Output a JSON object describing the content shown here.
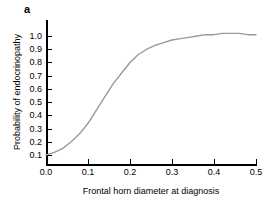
{
  "panel": {
    "label": "a"
  },
  "chart_data": {
    "type": "line",
    "title": "",
    "xlabel": "Frontal horn diameter at diagnosis",
    "ylabel": "Probability of endocrinopathy",
    "xlim": [
      0.0,
      0.5
    ],
    "ylim": [
      0.06,
      1.03
    ],
    "grid": false,
    "legend": null,
    "line_color": "#9a9a9a",
    "axis_color": "#000000",
    "xticks": [
      "0.0",
      "0.1",
      "0.2",
      "0.3",
      "0.4",
      "0.5"
    ],
    "xtick_values": [
      0.0,
      0.1,
      0.2,
      0.3,
      0.4,
      0.5
    ],
    "yticks": [
      "0.1",
      "0.2",
      "0.3",
      "0.4",
      "0.5",
      "0.6",
      "0.7",
      "0.8",
      "0.9",
      "1.0"
    ],
    "ytick_values": [
      0.1,
      0.2,
      0.3,
      0.4,
      0.5,
      0.6,
      0.7,
      0.8,
      0.9,
      1.0
    ],
    "series": [
      {
        "name": "Probability of endocrinopathy",
        "x": [
          0.0,
          0.02,
          0.04,
          0.06,
          0.08,
          0.1,
          0.12,
          0.14,
          0.16,
          0.18,
          0.2,
          0.22,
          0.24,
          0.26,
          0.28,
          0.3,
          0.32,
          0.34,
          0.36,
          0.38,
          0.4,
          0.42,
          0.44,
          0.46,
          0.48,
          0.5
        ],
        "y": [
          0.1,
          0.12,
          0.15,
          0.2,
          0.26,
          0.34,
          0.44,
          0.54,
          0.64,
          0.72,
          0.8,
          0.86,
          0.9,
          0.93,
          0.95,
          0.97,
          0.98,
          0.99,
          1.0,
          1.01,
          1.01,
          1.02,
          1.02,
          1.02,
          1.01,
          1.01
        ]
      }
    ]
  }
}
